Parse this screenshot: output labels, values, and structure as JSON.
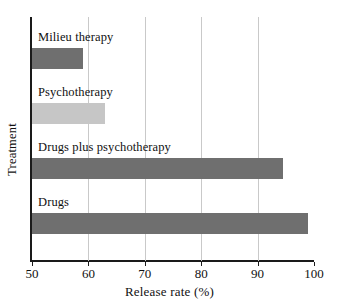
{
  "chart_data": {
    "type": "bar",
    "orientation": "horizontal",
    "title": "",
    "xlabel": "Release rate (%)",
    "ylabel": "Treatment",
    "categories": [
      "Drugs",
      "Drugs plus psychotherapy",
      "Psychotherapy",
      "Milieu therapy"
    ],
    "values": [
      99,
      94.5,
      63,
      59
    ],
    "xlim": [
      50,
      100
    ],
    "xticks": [
      50,
      60,
      70,
      80,
      90,
      100
    ],
    "xtick_labels": [
      "50",
      "60",
      "70",
      "80",
      "90",
      "100"
    ],
    "grid": "vertical gridlines at 60, 70, 80, 90",
    "legend": "none",
    "bar_colors": [
      "#6f6f6f",
      "#6f6f6f",
      "#c6c6c6",
      "#6f6f6f"
    ],
    "series": [
      {
        "name": "Release rate",
        "points": [
          {
            "category": "Milieu therapy",
            "value": 59,
            "color": "#6f6f6f"
          },
          {
            "category": "Psychotherapy",
            "value": 63,
            "color": "#c6c6c6"
          },
          {
            "category": "Drugs plus psychotherapy",
            "value": 94.5,
            "color": "#6f6f6f"
          },
          {
            "category": "Drugs",
            "value": 99,
            "color": "#6f6f6f"
          }
        ]
      }
    ]
  },
  "axes": {
    "x_title": "Release rate (%)",
    "y_title": "Treatment",
    "x_tick_labels": [
      "50",
      "60",
      "70",
      "80",
      "90",
      "100"
    ]
  },
  "bars": [
    {
      "label": "Milieu therapy",
      "value": 59,
      "color": "#6f6f6f"
    },
    {
      "label": "Psychotherapy",
      "value": 63,
      "color": "#c6c6c6"
    },
    {
      "label": "Drugs plus psychotherapy",
      "value": 94.5,
      "color": "#6f6f6f"
    },
    {
      "label": "Drugs",
      "value": 99,
      "color": "#6f6f6f"
    }
  ]
}
